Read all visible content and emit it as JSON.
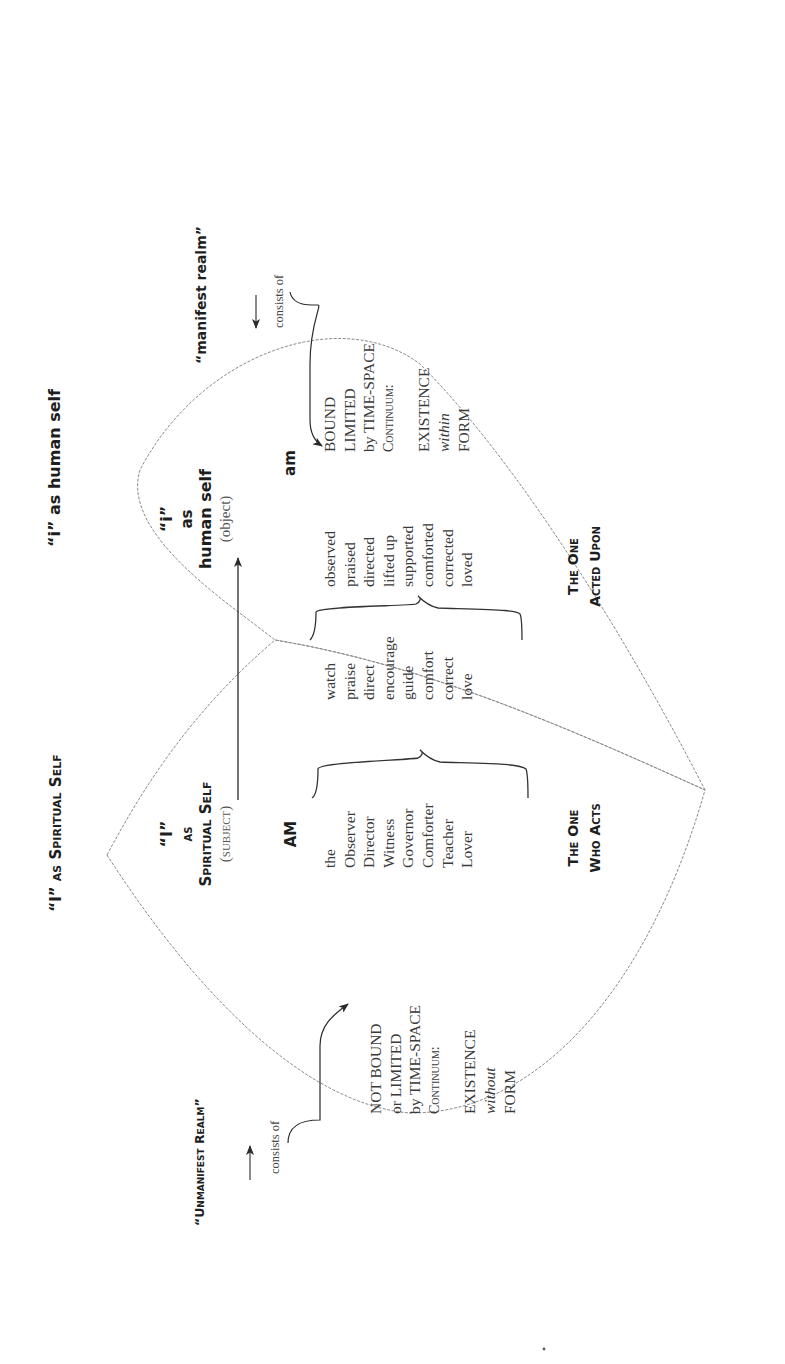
{
  "orientation": "rotated 90 degrees counter-clockwise",
  "titles": {
    "spiritual": "“I” as Spiritual Self",
    "human": "“i” as human self"
  },
  "spiritual_self": {
    "pronoun": "“I”",
    "as": "as",
    "name": "Spiritual Self",
    "role": "(subject)",
    "verb": "AM",
    "nouns": [
      "the",
      "Observer",
      "Director",
      "Witness",
      "Governor",
      "Comforter",
      "Teacher",
      "Lover"
    ],
    "caption_line1": "The One",
    "caption_line2": "Who Acts"
  },
  "actions": {
    "verbs": [
      "watch",
      "praise",
      "direct",
      "encourage",
      "guide",
      "comfort",
      "correct",
      "love"
    ]
  },
  "human_self": {
    "pronoun": "“i”",
    "as": "as",
    "name": "human self",
    "role": "(object)",
    "verb": "am",
    "passive_verbs": [
      "observed",
      "praised",
      "directed",
      "lifted up",
      "supported",
      "comforted",
      "corrected",
      "loved"
    ],
    "caption_line1": "The One",
    "caption_line2": "Acted Upon"
  },
  "unmanifest": {
    "label": "“Unmanifest Realm”",
    "consists_of": "consists of",
    "lines": [
      "NOT BOUND",
      "or LIMITED",
      "by TIME-SPACE",
      "Continuum:"
    ],
    "existence": [
      "EXISTENCE",
      "without",
      "FORM"
    ]
  },
  "manifest": {
    "label": "“manifest realm”",
    "consists_of": "consists of",
    "lines": [
      "BOUND",
      "LIMITED",
      "by TIME-SPACE",
      "Continuum:"
    ],
    "existence": [
      "EXISTENCE",
      "within",
      "FORM"
    ]
  },
  "colors": {
    "ink": "#222222",
    "outline": "#8a8a8a",
    "background": "#ffffff"
  }
}
